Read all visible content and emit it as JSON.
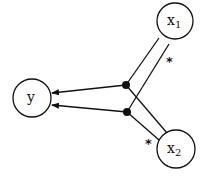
{
  "diagram": {
    "nodes": [
      {
        "id": "y",
        "label": "y",
        "sub": ""
      },
      {
        "id": "x1",
        "label": "x",
        "sub": "1"
      },
      {
        "id": "x2",
        "label": "x",
        "sub": "2"
      }
    ],
    "annotations": [
      {
        "near": "x1",
        "text": "*"
      },
      {
        "near": "x2",
        "text": "*"
      }
    ],
    "edges": [
      {
        "from": "x1",
        "to": "junction-1",
        "arrow": false
      },
      {
        "from": "x1",
        "to": "junction-2",
        "arrow": false
      },
      {
        "from": "x2",
        "to": "junction-1",
        "arrow": false
      },
      {
        "from": "x2",
        "to": "junction-2",
        "arrow": false
      },
      {
        "from": "junction-1",
        "to": "y",
        "arrow": true
      },
      {
        "from": "junction-2",
        "to": "y",
        "arrow": true
      }
    ],
    "colors": {
      "stroke": "#111111",
      "background": "#ffffff"
    }
  }
}
